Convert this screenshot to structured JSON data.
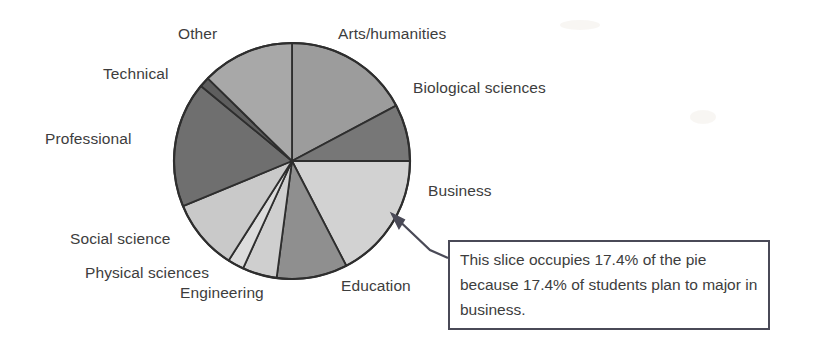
{
  "figure": {
    "title": "",
    "callout": {
      "text": "This slice occupies 17.4% of the pie because 17.4% of students plan to major in business.",
      "target_slice": "Business",
      "border_color": "#4a4a57"
    }
  },
  "chart_data": {
    "type": "pie",
    "title": "",
    "xlabel": "",
    "ylabel": "",
    "legend_position": "outside-labels",
    "grid": false,
    "start_angle_deg": 0,
    "direction": "clockwise",
    "categories": [
      "Arts/humanities",
      "Biological sciences",
      "Business",
      "Education",
      "Engineering",
      "Physical sciences",
      "Social science",
      "Professional",
      "Technical",
      "Other"
    ],
    "values": [
      17.2,
      7.8,
      17.4,
      9.7,
      4.7,
      2.2,
      9.7,
      17.2,
      1.4,
      12.5
    ],
    "unit": "percent",
    "colors": [
      "#9c9c9c",
      "#777777",
      "#d2d2d2",
      "#8f8f8f",
      "#cfcfcf",
      "#dcdcdc",
      "#c9c9c9",
      "#6f6f6f",
      "#5e5e5e",
      "#a8a8a8"
    ],
    "slice_angles_deg": [
      {
        "name": "Arts/humanities",
        "start": 0,
        "end": 62
      },
      {
        "name": "Biological sciences",
        "start": 62,
        "end": 90
      },
      {
        "name": "Business",
        "start": 90,
        "end": 152.6
      },
      {
        "name": "Education",
        "start": 152.6,
        "end": 187.5
      },
      {
        "name": "Engineering",
        "start": 187.5,
        "end": 204.5
      },
      {
        "name": "Physical sciences",
        "start": 204.5,
        "end": 212.5
      },
      {
        "name": "Social science",
        "start": 212.5,
        "end": 247.5
      },
      {
        "name": "Professional",
        "start": 247.5,
        "end": 309.5
      },
      {
        "name": "Technical",
        "start": 309.5,
        "end": 314.5
      },
      {
        "name": "Other",
        "start": 314.5,
        "end": 360
      }
    ],
    "annotations": [
      "This slice occupies 17.4% of the pie because 17.4% of students plan to major in business."
    ]
  },
  "labels": {
    "other": "Other",
    "arts": "Arts/humanities",
    "technical": "Technical",
    "biological": "Biological sciences",
    "professional": "Professional",
    "business": "Business",
    "social": "Social science",
    "physical": "Physical sciences",
    "engineering": "Engineering",
    "education": "Education"
  }
}
